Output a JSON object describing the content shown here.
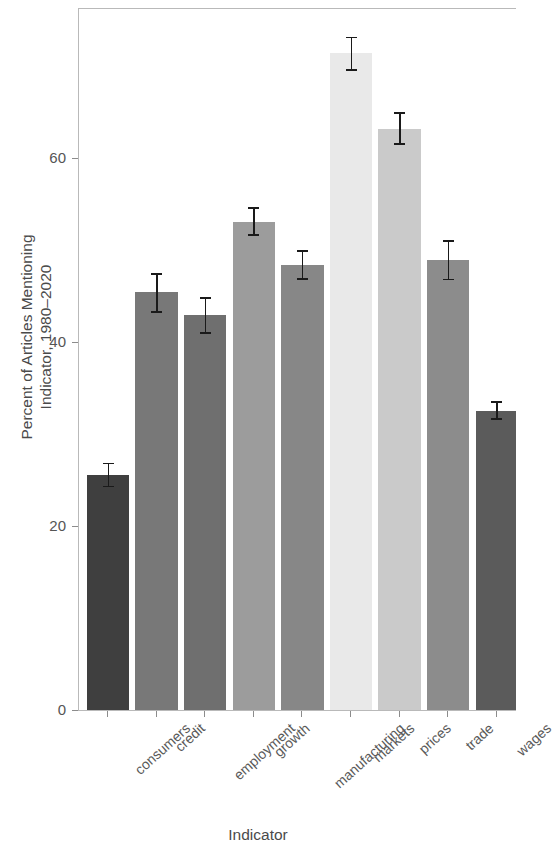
{
  "chart_data": {
    "type": "bar",
    "title": "",
    "xlabel": "Indicator",
    "ylabel": "Percent of Articles Mentioning\nIndicator, 1980–2020",
    "categories": [
      "consumers",
      "credit",
      "employment",
      "growth",
      "manufacturing",
      "markets",
      "prices",
      "trade",
      "wages"
    ],
    "values": [
      25.7,
      45.5,
      43.0,
      53.2,
      48.5,
      71.5,
      63.3,
      49.0,
      32.6
    ],
    "errors_low": [
      24.3,
      43.3,
      41.0,
      51.6,
      46.9,
      69.6,
      61.5,
      46.8,
      31.6
    ],
    "errors_high": [
      27.0,
      47.6,
      45.0,
      54.8,
      50.1,
      73.3,
      65.1,
      51.2,
      33.7
    ],
    "bar_colors": [
      "#3f3f3f",
      "#787878",
      "#6f6f6f",
      "#9c9c9c",
      "#878787",
      "#e9e9e9",
      "#cacaca",
      "#8c8c8c",
      "#5b5b5b"
    ],
    "ylim": [
      0,
      77
    ],
    "yticks": [
      0,
      20,
      40,
      60
    ],
    "ytick_labels": [
      "0",
      "20",
      "40",
      "60"
    ],
    "grid": false,
    "legend": null,
    "error_bar_color": "#1a1a1a",
    "panel_border_color": "#b9b9b9",
    "axis_text_color": "#555555"
  },
  "axes": {
    "y_title": "Percent of Articles Mentioning\nIndicator, 1980–2020",
    "x_title": "Indicator"
  }
}
